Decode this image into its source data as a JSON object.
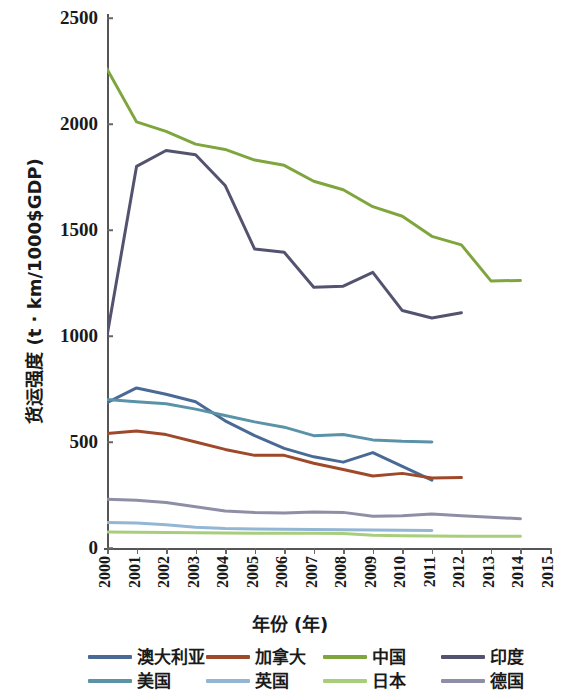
{
  "chart_data": {
    "type": "line",
    "title": "",
    "xlabel": "年份 (年)",
    "ylabel": "货运强度 (t · km/1000$GDP)",
    "xlim": [
      2000,
      2015
    ],
    "ylim": [
      0,
      2500
    ],
    "ytick_labels": [
      "0",
      "500",
      "1000",
      "1500",
      "2000",
      "2500"
    ],
    "ytick_values": [
      0,
      500,
      1000,
      1500,
      2000,
      2500
    ],
    "xtick_labels": [
      "2000",
      "2001",
      "2002",
      "2003",
      "2004",
      "2005",
      "2006",
      "2007",
      "2008",
      "2009",
      "2010",
      "2011",
      "2012",
      "2013",
      "2014",
      "2015"
    ],
    "xtick_values": [
      2000,
      2001,
      2002,
      2003,
      2004,
      2005,
      2006,
      2007,
      2008,
      2009,
      2010,
      2011,
      2012,
      2013,
      2014,
      2015
    ],
    "grid": false,
    "legend_position": "bottom",
    "series": [
      {
        "name": "澳大利亚",
        "color": "#4a6a96",
        "x": [
          2000,
          2001,
          2002,
          2003,
          2004,
          2005,
          2006,
          2007,
          2008,
          2009,
          2010,
          2011
        ],
        "values": [
          685,
          755,
          725,
          690,
          600,
          530,
          470,
          430,
          405,
          450,
          385,
          320
        ]
      },
      {
        "name": "加拿大",
        "color": "#9e4a2a",
        "x": [
          2000,
          2001,
          2002,
          2003,
          2004,
          2005,
          2006,
          2007,
          2008,
          2009,
          2010,
          2011,
          2012
        ],
        "values": [
          540,
          552,
          535,
          500,
          465,
          437,
          437,
          400,
          370,
          340,
          352,
          330,
          332
        ]
      },
      {
        "name": "中国",
        "color": "#7fa63c",
        "x": [
          2000,
          2001,
          2002,
          2003,
          2004,
          2005,
          2006,
          2007,
          2008,
          2009,
          2010,
          2011,
          2012,
          2013,
          2014
        ],
        "values": [
          2260,
          2010,
          1965,
          1905,
          1880,
          1830,
          1805,
          1730,
          1690,
          1610,
          1565,
          1470,
          1430,
          1260,
          1262
        ]
      },
      {
        "name": "印度",
        "color": "#535370",
        "x": [
          2000,
          2001,
          2002,
          2003,
          2004,
          2005,
          2006,
          2007,
          2008,
          2009,
          2010,
          2011,
          2012
        ],
        "values": [
          1000,
          1800,
          1875,
          1855,
          1710,
          1410,
          1395,
          1230,
          1235,
          1300,
          1120,
          1085,
          1110
        ]
      },
      {
        "name": "美国",
        "color": "#5a93a8",
        "x": [
          2000,
          2001,
          2002,
          2003,
          2004,
          2005,
          2006,
          2007,
          2008,
          2009,
          2010,
          2011
        ],
        "values": [
          700,
          690,
          680,
          655,
          625,
          595,
          570,
          530,
          535,
          510,
          503,
          500
        ]
      },
      {
        "name": "英国",
        "color": "#93b6d4",
        "x": [
          2000,
          2001,
          2002,
          2003,
          2004,
          2005,
          2006,
          2007,
          2008,
          2009,
          2010,
          2011
        ],
        "values": [
          120,
          118,
          110,
          98,
          92,
          90,
          88,
          87,
          86,
          85,
          84,
          83
        ]
      },
      {
        "name": "日本",
        "color": "#a8ce7c",
        "x": [
          2000,
          2001,
          2002,
          2003,
          2004,
          2005,
          2006,
          2007,
          2008,
          2009,
          2010,
          2011,
          2012,
          2013,
          2014
        ],
        "values": [
          75,
          74,
          73,
          72,
          71,
          70,
          70,
          70,
          68,
          60,
          58,
          57,
          56,
          56,
          55
        ]
      },
      {
        "name": "德国",
        "color": "#8e8fa6",
        "x": [
          2000,
          2001,
          2002,
          2003,
          2004,
          2005,
          2006,
          2007,
          2008,
          2009,
          2010,
          2011,
          2012,
          2013,
          2014
        ],
        "values": [
          230,
          225,
          215,
          195,
          175,
          168,
          165,
          170,
          168,
          150,
          152,
          160,
          152,
          145,
          138
        ]
      }
    ]
  },
  "legend": {
    "items": [
      {
        "label": "澳大利亚",
        "color": "#4a6a96"
      },
      {
        "label": "加拿大",
        "color": "#9e4a2a"
      },
      {
        "label": "中国",
        "color": "#7fa63c"
      },
      {
        "label": "印度",
        "color": "#535370"
      },
      {
        "label": "美国",
        "color": "#5a93a8"
      },
      {
        "label": "英国",
        "color": "#93b6d4"
      },
      {
        "label": "日本",
        "color": "#a8ce7c"
      },
      {
        "label": "德国",
        "color": "#8e8fa6"
      }
    ]
  }
}
